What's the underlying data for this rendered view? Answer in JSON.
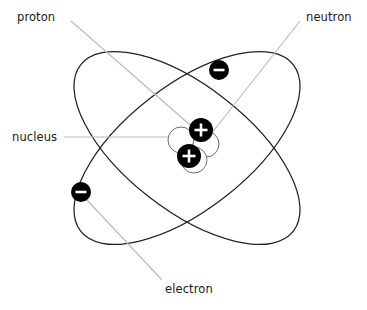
{
  "diagram": {
    "canvas": {
      "width": 367,
      "height": 310,
      "background": "#ffffff"
    },
    "colors": {
      "orbit_stroke": "#222222",
      "leader_line": "#b9b9b9",
      "label_text": "#1a1a1a",
      "proton_fill": "#000000",
      "electron_fill": "#000000",
      "neutron_fill": "#ffffff",
      "neutron_stroke": "#6e6e6e",
      "charge_glyph": "#ffffff"
    },
    "labels": {
      "proton": "proton",
      "neutron": "neutron",
      "nucleus": "nucleus",
      "electron": "electron"
    },
    "particles": {
      "protons": [
        {
          "name": "proton-1",
          "charge": "+",
          "x": 201,
          "y": 130,
          "r": 12
        },
        {
          "name": "proton-2",
          "charge": "+",
          "x": 189,
          "y": 156,
          "r": 12
        }
      ],
      "electrons": [
        {
          "name": "electron-1",
          "charge": "-",
          "x": 219,
          "y": 70,
          "r": 10
        },
        {
          "name": "electron-2",
          "charge": "-",
          "x": 81,
          "y": 192,
          "r": 10
        }
      ],
      "neutrons": [
        {
          "name": "neutron-1",
          "x": 181,
          "y": 140,
          "r": 13
        },
        {
          "name": "neutron-2",
          "x": 206,
          "y": 144,
          "r": 13
        },
        {
          "name": "neutron-3",
          "x": 194,
          "y": 160,
          "r": 13
        }
      ]
    },
    "orbits": [
      {
        "name": "orbit-1",
        "cx": 187,
        "cy": 148,
        "rx": 135,
        "ry": 62,
        "rotation": -38
      },
      {
        "name": "orbit-2",
        "cx": 187,
        "cy": 148,
        "rx": 135,
        "ry": 62,
        "rotation": 38
      }
    ],
    "leaders": [
      {
        "name": "proton-leader",
        "from": [
          71,
          21
        ],
        "to": [
          197,
          131
        ]
      },
      {
        "name": "neutron-leader",
        "from": [
          300,
          21
        ],
        "to": [
          200,
          148
        ]
      },
      {
        "name": "nucleus-leader",
        "from": [
          64,
          137
        ],
        "to": [
          180,
          137
        ]
      },
      {
        "name": "electron-leader",
        "from": [
          86,
          199
        ],
        "to": [
          162,
          280
        ]
      }
    ]
  }
}
